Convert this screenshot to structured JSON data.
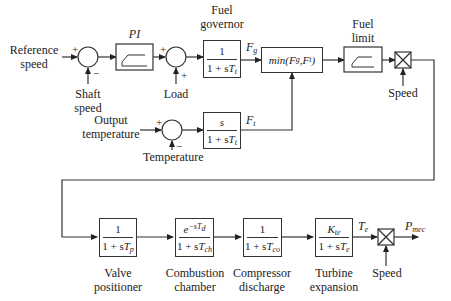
{
  "diagram": {
    "inputs": {
      "reference_speed": "Reference speed",
      "reference_speed_l1": "Reference",
      "reference_speed_l2": "speed",
      "shaft_speed_l1": "Shaft",
      "shaft_speed_l2": "speed",
      "load": "Load",
      "output_temperature_l1": "Output",
      "output_temperature_l2": "temperature",
      "temperature": "Temperature",
      "speed_top": "Speed",
      "speed_bottom": "Speed"
    },
    "signs": {
      "sum1_plus": "+",
      "sum1_minus": "−",
      "sum2_plus_left": "+",
      "sum2_plus_bottom": "+",
      "sum3_plus": "+",
      "sum3_minus": "−"
    },
    "blocks": {
      "pi": {
        "label": "PI"
      },
      "fuel_governor": {
        "label_l1": "Fuel",
        "label_l2": "governor",
        "num": "1",
        "den_prefix": "1 + s",
        "den_var": "T",
        "den_sub": "t"
      },
      "min": {
        "text_prefix": "min(",
        "a": "F",
        "a_sub": "g",
        "sep": ",",
        "b": "F",
        "b_sub": "t",
        "text_suffix": ")"
      },
      "fuel_limit": {
        "label_l1": "Fuel",
        "label_l2": "limit"
      },
      "temperature_tf": {
        "num": "s",
        "den_prefix": "1 + s",
        "den_var": "T",
        "den_sub": "t"
      },
      "valve_positioner": {
        "label_l1": "Valve",
        "label_l2": "positioner",
        "num": "1",
        "den_prefix": "1 + s",
        "den_var": "T",
        "den_sub": "p"
      },
      "combustion_chamber": {
        "label_l1": "Combustion",
        "label_l2": "chamber",
        "num_base": "e",
        "num_exp": "−sT",
        "num_exp_sub": "d",
        "den_prefix": "1 + s",
        "den_var": "T",
        "den_sub": "ch"
      },
      "compressor_discharge": {
        "label_l1": "Compressor",
        "label_l2": "discharge",
        "num": "1",
        "den_prefix": "1 + s",
        "den_var": "T",
        "den_sub": "co"
      },
      "turbine_expansion": {
        "label_l1": "Turbine",
        "label_l2": "expansion",
        "num_var": "K",
        "num_sub": "te",
        "den_prefix": "1 + s",
        "den_var": "T",
        "den_sub": "e"
      }
    },
    "signals": {
      "fg": "F",
      "fg_sub": "g",
      "ft": "F",
      "ft_sub": "t",
      "te": "T",
      "te_sub": "e",
      "pmec": "P",
      "pmec_sub": "mec"
    },
    "colors": {
      "line": "#333333",
      "text": "#222222",
      "background": "#ffffff"
    }
  }
}
